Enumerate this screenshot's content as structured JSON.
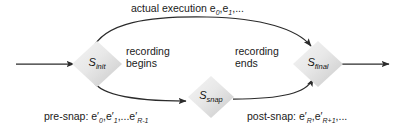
{
  "diagram": {
    "background_color": "#ffffff",
    "line_color": "#2b2b2b",
    "node_fill_light": "#efefef",
    "node_fill_dark": "#cfcfcf",
    "nodes": [
      {
        "id": "init",
        "base": "S",
        "subscript": "init",
        "x": 97,
        "y": 64
      },
      {
        "id": "snap",
        "base": "S",
        "subscript": "snap",
        "x": 211,
        "y": 97
      },
      {
        "id": "final",
        "base": "S",
        "subscript": "final",
        "x": 318,
        "y": 64
      }
    ],
    "labels": {
      "top_execution": {
        "text": "actual execution e",
        "sub1": "0",
        "sep": ",e",
        "sub2": "1",
        "tail": ",..."
      },
      "recording_begins": {
        "line1": "recording",
        "line2": "begins"
      },
      "recording_ends": {
        "line1": "recording",
        "line2": "ends"
      },
      "pre_snap": {
        "prefix": "pre-snap: e′",
        "sub1": "0",
        "sep1": ",e′",
        "sub2": "1",
        "sep2": ",...e′",
        "sub3": "R-1"
      },
      "post_snap": {
        "prefix": "post-snap: e′",
        "sub1": "R",
        "sep1": ",e′",
        "sub2": "R+1",
        "tail": ",..."
      }
    },
    "arrows": {
      "entry": "incoming horizontal arrow into S_init",
      "exit": "outgoing horizontal arrow from S_final",
      "top_arc": "S_init to S_final actual execution arc",
      "lower_left_arc": "S_init to S_snap pre-snap arc",
      "lower_right_arc": "S_snap to S_final post-snap arc"
    }
  }
}
